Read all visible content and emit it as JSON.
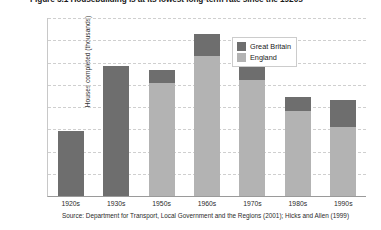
{
  "figure": {
    "title": "Figure 5.1  Housebuilding is at its lowest long-term rate since the 1920s",
    "source": "Source: Department for Transport, Local Government and the Regions (2001); Hicks and Allen (1999)"
  },
  "chart_data": {
    "type": "bar",
    "stacked": true,
    "title": "Figure 5.1  Housebuilding is at its lowest long-term rate since the 1920s",
    "xlabel": "",
    "ylabel": "Houses completed (thousands)",
    "ylim": [
      0,
      400
    ],
    "yticks": [
      0,
      50,
      100,
      150,
      200,
      250,
      300,
      350,
      400
    ],
    "ytick_labels": [
      "0",
      "50",
      "100",
      "150",
      "200",
      "250",
      "300",
      "350",
      "400"
    ],
    "grid": true,
    "legend_position": "top-right",
    "categories": [
      "1920s",
      "1930s",
      "1950s",
      "1960s",
      "1970s",
      "1980s",
      "1990s"
    ],
    "series": [
      {
        "name": "England",
        "color": "#b3b3b3",
        "values": [
          0,
          0,
          255,
          315,
          260,
          192,
          155
        ]
      },
      {
        "name": "Great Britain",
        "color": "#6e6e6e",
        "values": [
          145,
          293,
          283,
          365,
          313,
          222,
          215
        ],
        "note": "Great Britain is the bar total; the dark segment is the amount above England"
      }
    ],
    "totals": [
      145,
      293,
      283,
      365,
      313,
      222,
      215
    ]
  },
  "legend": {
    "items": [
      {
        "label": "Great Britain",
        "color": "#6e6e6e"
      },
      {
        "label": "England",
        "color": "#b3b3b3"
      }
    ]
  },
  "colors": {
    "great_britain": "#6e6e6e",
    "england": "#b3b3b3",
    "gridline": "#cfcfcf",
    "axis": "#9a9a9a",
    "text": "#1a1a1a",
    "background": "#ffffff"
  }
}
